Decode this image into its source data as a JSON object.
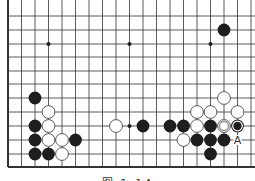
{
  "diagram": {
    "type": "go-board-fragment",
    "colors": {
      "line": "#333333",
      "black": "#1e1e1e",
      "white": "#ffffff",
      "marker_gray": "#999999"
    },
    "grid": {
      "x0": 8,
      "dx": 13.5,
      "y_lines": [
        16,
        30,
        44,
        57,
        71,
        84,
        98,
        112,
        126,
        140,
        154,
        167
      ],
      "cols": 19,
      "left_edge": true,
      "bottom_edge": true
    },
    "hoshi": [
      [
        3,
        2
      ],
      [
        9,
        2
      ],
      [
        15,
        2
      ],
      [
        9,
        8
      ]
    ],
    "stones": [
      {
        "color": "black",
        "col": 16,
        "row": 1
      },
      {
        "color": "black",
        "col": 2,
        "row": 6
      },
      {
        "color": "white",
        "col": 3,
        "row": 7
      },
      {
        "color": "black",
        "col": 2,
        "row": 8
      },
      {
        "color": "white",
        "col": 3,
        "row": 8
      },
      {
        "color": "black",
        "col": 2,
        "row": 9
      },
      {
        "color": "white",
        "col": 3,
        "row": 9
      },
      {
        "color": "white",
        "col": 4,
        "row": 9
      },
      {
        "color": "black",
        "col": 5,
        "row": 9
      },
      {
        "color": "black",
        "col": 2,
        "row": 10
      },
      {
        "color": "black",
        "col": 3,
        "row": 10
      },
      {
        "color": "white",
        "col": 4,
        "row": 10
      },
      {
        "color": "white",
        "col": 8,
        "row": 8
      },
      {
        "color": "black",
        "col": 10,
        "row": 8
      },
      {
        "color": "black",
        "col": 12,
        "row": 8
      },
      {
        "color": "black",
        "col": 13,
        "row": 8
      },
      {
        "color": "white",
        "col": 16,
        "row": 6
      },
      {
        "color": "white",
        "col": 14,
        "row": 7
      },
      {
        "color": "white",
        "col": 15,
        "row": 7
      },
      {
        "color": "white",
        "col": 17,
        "row": 7
      },
      {
        "color": "white",
        "col": 14,
        "row": 8
      },
      {
        "color": "black",
        "col": 15,
        "row": 8
      },
      {
        "color": "white",
        "col": 16,
        "row": 8,
        "marker": "gray-ring"
      },
      {
        "color": "black",
        "col": 17,
        "row": 8,
        "marker": "white-ring"
      },
      {
        "color": "white",
        "col": 13,
        "row": 9
      },
      {
        "color": "black",
        "col": 14,
        "row": 9
      },
      {
        "color": "black",
        "col": 15,
        "row": 9
      },
      {
        "color": "black",
        "col": 16,
        "row": 9
      },
      {
        "color": "black",
        "col": 15,
        "row": 10
      }
    ],
    "labels": [
      {
        "text": "A",
        "col": 17,
        "row": 9
      }
    ],
    "caption": "图 1-14"
  }
}
